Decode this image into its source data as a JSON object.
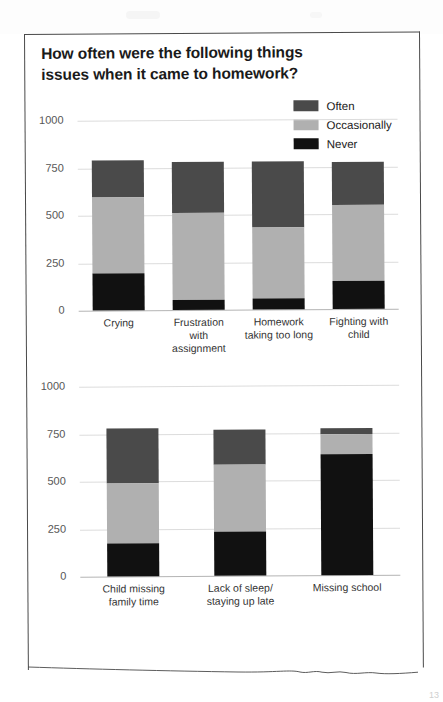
{
  "page": {
    "title_line1": "How often were the following things",
    "title_line2": "issues when it came to homework?",
    "corner_mark": "13"
  },
  "legend": {
    "items": [
      {
        "label": "Often",
        "color": "#4a4a4a"
      },
      {
        "label": "Occasionally",
        "color": "#b0b0b0"
      },
      {
        "label": "Never",
        "color": "#111111"
      }
    ]
  },
  "colors": {
    "often": "#4a4a4a",
    "occasionally": "#b0b0b0",
    "never": "#111111",
    "gridline": "#dcdcdc",
    "axis": "#b4b4b4",
    "text": "#333333"
  },
  "chart_data": [
    {
      "type": "bar",
      "title": "How often were the following things issues when it came to homework?",
      "subtitle": "",
      "stacked": true,
      "xlabel": "",
      "ylabel": "",
      "ylim": [
        0,
        1000
      ],
      "yticks": [
        0,
        250,
        500,
        750,
        1000
      ],
      "ytick_labels": [
        "0",
        "250",
        "500",
        "750",
        "1000"
      ],
      "grid": true,
      "legend_position": "top-right",
      "categories": [
        "Crying",
        "Frustration with assignment",
        "Homework taking too long",
        "Fighting with child"
      ],
      "category_lines": [
        [
          "Crying"
        ],
        [
          "Frustration",
          "with",
          "assignment"
        ],
        [
          "Homework",
          "taking too long"
        ],
        [
          "Fighting with",
          "child"
        ]
      ],
      "series": [
        {
          "name": "Never",
          "color": "#111111",
          "values": [
            195,
            55,
            60,
            145
          ]
        },
        {
          "name": "Occasionally",
          "color": "#b0b0b0",
          "values": [
            400,
            455,
            370,
            400
          ]
        },
        {
          "name": "Often",
          "color": "#4a4a4a",
          "values": [
            195,
            270,
            350,
            230
          ]
        }
      ],
      "totals": [
        790,
        780,
        780,
        775
      ]
    },
    {
      "type": "bar",
      "title": "",
      "subtitle": "",
      "stacked": true,
      "xlabel": "",
      "ylabel": "",
      "ylim": [
        0,
        1000
      ],
      "yticks": [
        0,
        250,
        500,
        750,
        1000
      ],
      "ytick_labels": [
        "0",
        "250",
        "500",
        "750",
        "1000"
      ],
      "grid": true,
      "legend_position": "none",
      "categories": [
        "Child missing family time",
        "Lack of sleep/ staying up late",
        "Missing school"
      ],
      "category_lines": [
        [
          "Child missing",
          "family time"
        ],
        [
          "Lack of sleep/",
          "staying up late"
        ],
        [
          "Missing school"
        ]
      ],
      "series": [
        {
          "name": "Never",
          "color": "#111111",
          "values": [
            175,
            230,
            635
          ]
        },
        {
          "name": "Occasionally",
          "color": "#b0b0b0",
          "values": [
            315,
            355,
            105
          ]
        },
        {
          "name": "Often",
          "color": "#4a4a4a",
          "values": [
            290,
            185,
            35
          ]
        }
      ],
      "totals": [
        780,
        770,
        775
      ]
    }
  ]
}
